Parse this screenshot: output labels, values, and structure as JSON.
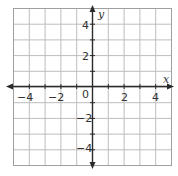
{
  "chart_data": {
    "type": "scatter",
    "title": "",
    "xlabel": "x",
    "ylabel": "y",
    "xlim": [
      -5,
      5
    ],
    "ylim": [
      -5,
      5
    ],
    "grid": true,
    "grid_step": 1,
    "x_ticks": [
      -4,
      -2,
      0,
      2,
      4
    ],
    "y_ticks": [
      4,
      2,
      -2,
      -4
    ],
    "x_tick_labels": [
      "−4",
      "−2",
      "0",
      "2",
      "4"
    ],
    "y_tick_labels": [
      "4",
      "2",
      "−2",
      "−4"
    ],
    "origin_label": "0",
    "series": [],
    "colors": {
      "grid": "#b8b8b8",
      "axis": "#2a2a2a",
      "border": "#9a9a9a"
    }
  }
}
